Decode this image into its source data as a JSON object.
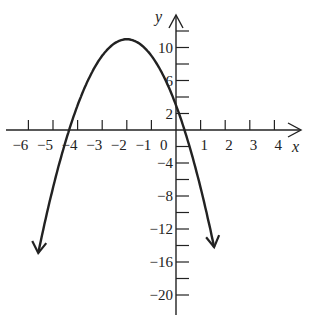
{
  "chart_data": {
    "type": "line",
    "title": "",
    "xlabel": "x",
    "ylabel": "y",
    "function": "y = -2x^2 - 8x + 3",
    "vertex": [
      -2,
      11
    ],
    "x_intercepts": [
      -4.35,
      0.35
    ],
    "y_intercept": 3,
    "x_tick_labels": [
      "-6",
      "-5",
      "-4",
      "-3",
      "-2",
      "-1",
      "0",
      "1",
      "2",
      "3",
      "4"
    ],
    "x_ticks": [
      -6,
      -5,
      -4,
      -3,
      -2,
      -1,
      1,
      2,
      3,
      4
    ],
    "y_tick_labels": [
      "10",
      "6",
      "2",
      "-4",
      "-8",
      "-12",
      "-16",
      "-20"
    ],
    "y_ticks": [
      12,
      10,
      8,
      6,
      4,
      2,
      -2,
      -4,
      -6,
      -8,
      -10,
      -12,
      -14,
      -16,
      -18,
      -20
    ],
    "xlim": [
      -6.6,
      4.9
    ],
    "ylim": [
      -21.5,
      12.5
    ],
    "grid": false,
    "legend": "none",
    "x": [
      -5.6,
      -5,
      -4.5,
      -4,
      -3.5,
      -3,
      -2.5,
      -2,
      -1.5,
      -1,
      -0.5,
      0,
      0.5,
      1.0,
      1.3
    ],
    "values": [
      -14.92,
      -7,
      -1.5,
      3,
      6.5,
      9,
      10.5,
      11,
      10.5,
      9,
      6.5,
      3,
      -1.5,
      -7,
      -10.78
    ],
    "arrows": "both ends point downward"
  },
  "labels": {
    "x_axis": "x",
    "y_axis": "y",
    "origin": "0"
  }
}
